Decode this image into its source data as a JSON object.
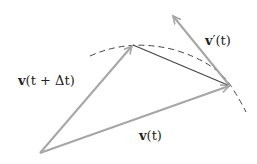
{
  "diagram": {
    "type": "vector-derivative",
    "colors": {
      "vector": "#a6a6a6",
      "chord": "#444444",
      "dashed_curve": "#444444",
      "text": "#222222",
      "background": "#ffffff"
    },
    "points": {
      "origin": [
        40,
        153
      ],
      "tip_v_t_plus_dt": [
        133,
        45
      ],
      "tip_v_t": [
        230,
        86
      ],
      "tip_v_prime": [
        172,
        15
      ]
    },
    "labels": {
      "v_t_plus_dt": {
        "bold": "v",
        "rest": "(t + Δt)"
      },
      "v_t": {
        "bold": "v",
        "rest": "(t)"
      },
      "v_prime_t": {
        "bold": "v",
        "rest": "′(t)"
      }
    }
  }
}
